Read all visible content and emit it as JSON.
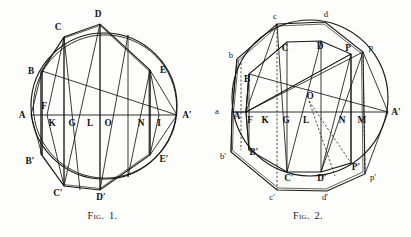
{
  "page": {
    "background_color": "#fdfdfb",
    "ink_color": "#161616"
  },
  "figures": [
    {
      "id": "fig-1",
      "caption_prefix": "Fig.",
      "caption_number": "1.",
      "description": "Circle with inscribed polygon, horizontal diameter A A-prime and chords",
      "circle": {
        "cx": 104,
        "cy": 106,
        "r": 73
      },
      "axis": {
        "label_left": "A",
        "label_right": "A′",
        "y": 115
      },
      "upper_points": [
        {
          "label": "B",
          "x": 42,
          "y": 71
        },
        {
          "label": "C",
          "x": 64,
          "y": 37
        },
        {
          "label": "D",
          "x": 100,
          "y": 24
        },
        {
          "label": "E",
          "x": 150,
          "y": 70
        }
      ],
      "lower_points": [
        {
          "label": "B′",
          "x": 42,
          "y": 155
        },
        {
          "label": "C′",
          "x": 64,
          "y": 186
        },
        {
          "label": "D′",
          "x": 100,
          "y": 190
        },
        {
          "label": "E′",
          "x": 150,
          "y": 155
        }
      ],
      "axis_points": [
        {
          "label": "A",
          "x": 22,
          "y": 118
        },
        {
          "label": "F",
          "x": 44,
          "y": 108
        },
        {
          "label": "K",
          "x": 51,
          "y": 125
        },
        {
          "label": "G",
          "x": 71,
          "y": 125
        },
        {
          "label": "L",
          "x": 89,
          "y": 125
        },
        {
          "label": "O",
          "x": 107,
          "y": 125
        },
        {
          "label": "N",
          "x": 140,
          "y": 125
        },
        {
          "label": "I",
          "x": 159,
          "y": 125
        },
        {
          "label": "A′",
          "x": 184,
          "y": 118
        }
      ]
    },
    {
      "id": "fig-2",
      "caption_prefix": "Fig.",
      "caption_number": "2.",
      "description": "Circle with two inscribed polygons (capital and lowercase vertices), diameter a A-prime, dashed construction lines",
      "circle": {
        "cx": 105,
        "cy": 98,
        "r": 78
      },
      "axis": {
        "label_left": "a",
        "label_right": "A′",
        "y": 112
      },
      "outer_points": [
        {
          "label": "b",
          "x": 32,
          "y": 59
        },
        {
          "label": "c",
          "x": 72,
          "y": 24
        },
        {
          "label": "d",
          "x": 120,
          "y": 22
        },
        {
          "label": "p",
          "x": 158,
          "y": 52
        }
      ],
      "outer_points_lower": [
        {
          "label": "b′",
          "x": 26,
          "y": 152
        },
        {
          "label": "c′",
          "x": 72,
          "y": 190
        },
        {
          "label": "d′",
          "x": 122,
          "y": 191
        },
        {
          "label": "p′",
          "x": 160,
          "y": 174
        }
      ],
      "inner_points": [
        {
          "label": "B",
          "x": 44,
          "y": 74
        },
        {
          "label": "C",
          "x": 82,
          "y": 42
        },
        {
          "label": "D",
          "x": 116,
          "y": 41
        },
        {
          "label": "P",
          "x": 146,
          "y": 54
        }
      ],
      "inner_points_lower": [
        {
          "label": "B′",
          "x": 44,
          "y": 150
        },
        {
          "label": "C′",
          "x": 82,
          "y": 172
        },
        {
          "label": "D′",
          "x": 116,
          "y": 172
        },
        {
          "label": "P′",
          "x": 146,
          "y": 163
        }
      ],
      "axis_points": [
        {
          "label": "a",
          "x": 13,
          "y": 112
        },
        {
          "label": "A",
          "x": 28,
          "y": 116
        },
        {
          "label": "F",
          "x": 41,
          "y": 121
        },
        {
          "label": "K",
          "x": 57,
          "y": 121
        },
        {
          "label": "G",
          "x": 78,
          "y": 121
        },
        {
          "label": "L",
          "x": 99,
          "y": 121
        },
        {
          "label": "O",
          "x": 104,
          "y": 95
        },
        {
          "label": "N",
          "x": 136,
          "y": 121
        },
        {
          "label": "M",
          "x": 156,
          "y": 121
        },
        {
          "label": "A′",
          "x": 182,
          "y": 114
        }
      ]
    }
  ]
}
